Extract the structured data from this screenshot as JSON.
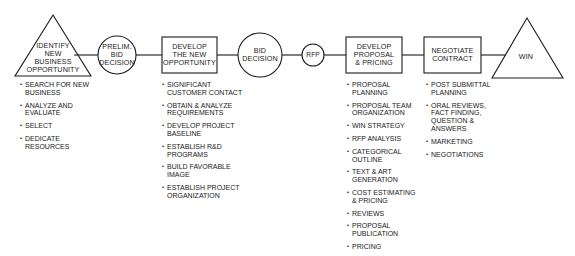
{
  "colors": {
    "stroke": "#1a1a1a",
    "background": "#ffffff",
    "text": "#1a1a1a"
  },
  "stages": [
    {
      "id": "identify",
      "shape": "triangle",
      "label_lines": [
        "IDENTIFY",
        "NEW",
        "BUSINESS",
        "OPPORTUNITY"
      ],
      "bullets": [
        [
          "SEARCH FOR NEW",
          "BUSINESS"
        ],
        [
          "ANALYZE AND",
          "EVALUATE"
        ],
        [
          "SELECT"
        ],
        [
          "DEDICATE",
          "RESOURCES"
        ]
      ]
    },
    {
      "id": "prelim",
      "shape": "circle",
      "label_lines": [
        "PRELIM.",
        "BID",
        "DECISION"
      ]
    },
    {
      "id": "develop-opportunity",
      "shape": "box",
      "label_lines": [
        "DEVELOP",
        "THE NEW",
        "OPPORTUNITY"
      ],
      "bullets": [
        [
          "SIGNIFICANT",
          "CUSTOMER CONTACT"
        ],
        [
          "OBTAIN & ANALYZE",
          "REQUIREMENTS"
        ],
        [
          "DEVELOP PROJECT",
          "BASELINE"
        ],
        [
          "ESTABLISH R&D",
          "PROGRAMS"
        ],
        [
          "BUILD FAVORABLE",
          "IMAGE"
        ],
        [
          "ESTABLISH PROJECT",
          "ORGANIZATION"
        ]
      ]
    },
    {
      "id": "bid",
      "shape": "circle",
      "label_lines": [
        "BID",
        "DECISION"
      ]
    },
    {
      "id": "rfp",
      "shape": "circle",
      "label_lines": [
        "RFP"
      ]
    },
    {
      "id": "develop-proposal",
      "shape": "box",
      "label_lines": [
        "DEVELOP",
        "PROPOSAL",
        "& PRICING"
      ],
      "bullets": [
        [
          "PROPOSAL",
          "PLANNING"
        ],
        [
          "PROPOSAL TEAM",
          "ORGANIZATION"
        ],
        [
          "WIN STRATEGY"
        ],
        [
          "RFP ANALYSIS"
        ],
        [
          "CATEGORICAL",
          "OUTLINE"
        ],
        [
          "TEXT & ART",
          "GENERATION"
        ],
        [
          "COST ESTIMATING",
          "& PRICING"
        ],
        [
          "REVIEWS"
        ],
        [
          "PROPOSAL",
          "PUBLICATION"
        ],
        [
          "PRICING"
        ]
      ]
    },
    {
      "id": "negotiate",
      "shape": "box",
      "label_lines": [
        "NEGOTIATE",
        "CONTRACT"
      ],
      "bullets": [
        [
          "POST SUBMITTAL",
          "PLANNING"
        ],
        [
          "ORAL REVIEWS,",
          "FACT FINDING,",
          "QUESTION &",
          "ANSWERS"
        ],
        [
          "MARKETING"
        ],
        [
          "NEGOTIATIONS"
        ]
      ]
    },
    {
      "id": "win",
      "shape": "triangle",
      "label_lines": [
        "WIN"
      ]
    }
  ]
}
